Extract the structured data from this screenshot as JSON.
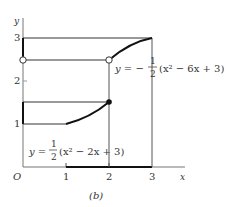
{
  "figure": {
    "caption": "(b)",
    "axes": {
      "x_label": "x",
      "y_label": "y",
      "origin_label": "O",
      "x_ticks": [
        "1",
        "2",
        "3"
      ],
      "y_ticks": [
        "1",
        "2",
        "3"
      ]
    },
    "equations": {
      "upper": {
        "lhs": "y = −",
        "num": "1",
        "den": "2",
        "rhs": "(x² − 6x + 3)"
      },
      "lower": {
        "lhs": "y =",
        "num": "1",
        "den": "2",
        "rhs": "(x² − 2x + 3)"
      }
    }
  }
}
